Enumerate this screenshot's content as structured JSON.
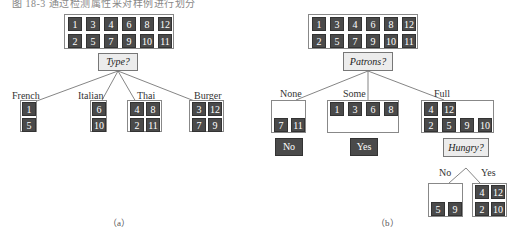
{
  "caption": "图 18-3  通过检测属性来对样例进行划分",
  "panel_a": {
    "label": "（a）",
    "root_top": [
      "1",
      "3",
      "4",
      "6",
      "8",
      "12"
    ],
    "root_bottom": [
      "2",
      "5",
      "7",
      "9",
      "10",
      "11"
    ],
    "question": "Type?",
    "branches": [
      {
        "label": "French",
        "top": [
          "1"
        ],
        "bottom": [
          "5"
        ]
      },
      {
        "label": "Italian",
        "top": [
          "6"
        ],
        "bottom": [
          "10"
        ]
      },
      {
        "label": "Thai",
        "top": [
          "4",
          "8"
        ],
        "bottom": [
          "2",
          "11"
        ]
      },
      {
        "label": "Burger",
        "top": [
          "3",
          "12"
        ],
        "bottom": [
          "7",
          "9"
        ]
      }
    ]
  },
  "panel_b": {
    "label": "（b）",
    "root_top": [
      "1",
      "3",
      "4",
      "6",
      "8",
      "12"
    ],
    "root_bottom": [
      "2",
      "5",
      "7",
      "9",
      "10",
      "11"
    ],
    "question": "Patrons?",
    "branches": [
      {
        "label": "None",
        "top": [],
        "bottom": [
          "7",
          "11"
        ],
        "result": "No"
      },
      {
        "label": "Some",
        "top": [
          "1",
          "3",
          "6",
          "8"
        ],
        "bottom": [],
        "result": "Yes"
      },
      {
        "label": "Full",
        "top": [
          "4",
          "12"
        ],
        "bottom": [
          "2",
          "5",
          "9",
          "10"
        ],
        "question": "Hungry?"
      }
    ],
    "sub_branches": [
      {
        "label": "No",
        "top": [],
        "bottom": [
          "5",
          "9"
        ]
      },
      {
        "label": "Yes",
        "top": [
          "4",
          "12"
        ],
        "bottom": [
          "2",
          "10"
        ]
      }
    ]
  }
}
